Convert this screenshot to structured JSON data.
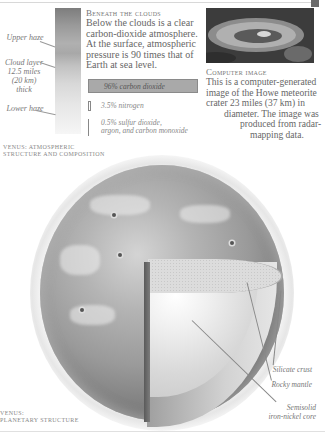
{
  "atmosphere": {
    "labels": {
      "upper_haze": "Upper haze",
      "cloud_layer": "Cloud layer 12.5 miles (20 km) thick",
      "cloud_line1": "Cloud layer",
      "cloud_line2": "12.5 miles",
      "cloud_line3": "(20 km)",
      "cloud_line4": "thick",
      "lower_haze": "Lower haze"
    },
    "caption_line1": "Venus: atmospheric",
    "caption_line2": "structure and composition"
  },
  "beneath_clouds": {
    "heading": "Beneath the clouds",
    "body": "Below the clouds is a clear carbon-dioxide atmosphere. At the surface, atmospheric pressure is 90 times that of Earth at sea level."
  },
  "composition": {
    "items": [
      {
        "label": "96% carbon dioxide",
        "percent": 96
      },
      {
        "label": "3.5% nitrogen",
        "percent": 3.5
      },
      {
        "label_line1": "0.5% sulfur dioxide,",
        "label_line2": "argon, and carbon monoxide",
        "percent": 0.5
      }
    ]
  },
  "computer_image": {
    "heading": "Computer image",
    "line1": "This is a computer-generated",
    "line2": "image of the Howe meteorite",
    "line3": "crater 23 miles (37 km) in",
    "line4": "diameter. The image was",
    "line5": "produced from radar-",
    "line6": "mapping data."
  },
  "planet_structure": {
    "caption_line1": "Venus:",
    "caption_line2": "planetary structure",
    "labels": {
      "crust": "Silicate crust",
      "mantle": "Rocky mantle",
      "core_line1": "Semisolid",
      "core_line2": "iron-nickel core"
    }
  }
}
